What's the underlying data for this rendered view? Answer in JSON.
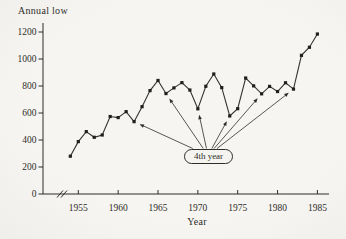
{
  "figure": {
    "title": "Annual low",
    "x_axis_title": "Year",
    "annotation_label": "4th year"
  },
  "colors": {
    "background": "#f4f3ef",
    "ink": "#2f2d2a",
    "series_line": "#35332f",
    "marker": "#211f1d"
  },
  "chart_data": {
    "type": "line",
    "title": "Annual low",
    "xlabel": "Year",
    "ylabel": "",
    "x": [
      1954,
      1955,
      1956,
      1957,
      1958,
      1959,
      1960,
      1961,
      1962,
      1963,
      1964,
      1965,
      1966,
      1967,
      1968,
      1969,
      1970,
      1971,
      1972,
      1973,
      1974,
      1975,
      1976,
      1977,
      1978,
      1979,
      1980,
      1981,
      1982,
      1983,
      1984,
      1985
    ],
    "values": [
      280,
      388,
      462,
      420,
      437,
      574,
      566,
      610,
      536,
      647,
      766,
      841,
      744,
      786,
      825,
      770,
      631,
      798,
      889,
      788,
      578,
      632,
      859,
      801,
      742,
      797,
      759,
      824,
      777,
      1027,
      1087,
      1185
    ],
    "xticks": [
      1955,
      1960,
      1965,
      1970,
      1975,
      1980,
      1985
    ],
    "yticks": [
      0,
      200,
      400,
      600,
      800,
      1000,
      1200
    ],
    "ylim": [
      0,
      1200
    ],
    "xlim_years": [
      1954,
      1985
    ],
    "grid": false,
    "legend": "none",
    "marker": "square",
    "x_axis_break": true,
    "annotation": {
      "label": "4th year",
      "target_years": [
        1962,
        1966,
        1970,
        1974,
        1978,
        1982
      ]
    }
  }
}
